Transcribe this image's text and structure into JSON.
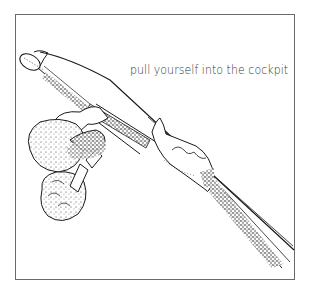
{
  "figure": {
    "caption": "pull yourself into the cockpit",
    "illustration": {
      "subject": "person pulling themselves into a kayak cockpit",
      "style": "black-and-white line drawing with stippling",
      "ink_color": "#1a1a1a",
      "border_color": "#6a6a6a",
      "background_color": "#ffffff"
    }
  }
}
